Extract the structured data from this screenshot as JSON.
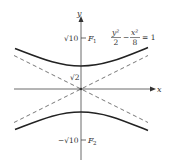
{
  "diagram": {
    "type": "hyperbola",
    "equation": {
      "num1": "y²",
      "den1": "2",
      "minus": "−",
      "num2": "x²",
      "den2": "8",
      "rhs": "= 1"
    },
    "axes": {
      "x_label": "x",
      "y_label": "y"
    },
    "labels": {
      "focus_top_value": "√10",
      "focus_top_name": "F",
      "focus_top_sub": "1",
      "vertex_value": "√2",
      "focus_bottom_value": "−√10",
      "focus_bottom_name": "F",
      "focus_bottom_sub": "2"
    },
    "asymptotes": "y = ±x/2",
    "colors": {
      "curve": "#222222",
      "asymptote": "#555555",
      "axis": "#444444"
    }
  }
}
